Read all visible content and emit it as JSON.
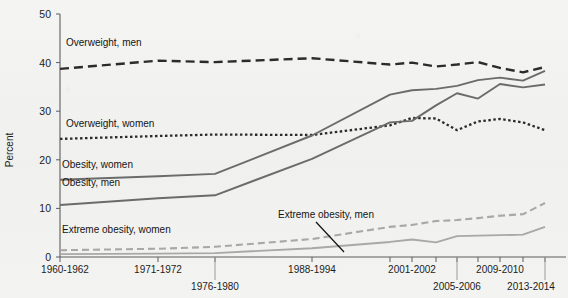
{
  "chart_data": {
    "type": "line",
    "title": "",
    "xlabel": "",
    "ylabel": "Percent",
    "ylim": [
      0,
      50
    ],
    "yticks": [
      0,
      10,
      20,
      30,
      40,
      50
    ],
    "grid": false,
    "legend": "inline-labels",
    "categories": [
      "1960-1962",
      "1971-1974",
      "1976-1980",
      "1988-1994",
      "1999-2000",
      "2001-2002",
      "2003-2004",
      "2005-2006",
      "2007-2008",
      "2009-2010",
      "2011-2012",
      "2013-2014"
    ],
    "x_tick_labels": [
      "1960-1962",
      "1971-1972",
      "1976-1980",
      "1988-1994",
      "2001-2002",
      "2005-2006",
      "2009-2010",
      "2013-2014"
    ],
    "series": [
      {
        "name": "Overweight, men",
        "style": "long-dash",
        "color": "#2b2b2b",
        "values": [
          38.7,
          40.4,
          40.1,
          40.9,
          39.6,
          40.0,
          39.2,
          39.6,
          40.1,
          38.9,
          38.0,
          39.1
        ]
      },
      {
        "name": "Overweight, women",
        "style": "dotted",
        "color": "#2b2b2b",
        "values": [
          24.3,
          24.9,
          25.2,
          25.1,
          27.1,
          28.6,
          28.5,
          26.1,
          27.9,
          28.4,
          27.7,
          26.1
        ]
      },
      {
        "name": "Obesity, women",
        "style": "solid",
        "color": "#6b6b6b",
        "values": [
          15.9,
          16.6,
          17.1,
          25.0,
          33.4,
          34.3,
          34.6,
          35.2,
          36.4,
          36.9,
          36.3,
          38.3
        ]
      },
      {
        "name": "Obesity, men",
        "style": "solid",
        "color": "#6b6b6b",
        "values": [
          10.7,
          12.1,
          12.7,
          20.2,
          27.7,
          28.0,
          31.2,
          33.7,
          32.6,
          35.6,
          34.9,
          35.5
        ]
      },
      {
        "name": "Extreme obesity, women",
        "style": "dashed",
        "color": "#a8a8a8",
        "values": [
          1.4,
          1.7,
          2.1,
          3.7,
          6.2,
          6.6,
          7.4,
          7.6,
          8.0,
          8.5,
          8.8,
          11.1
        ]
      },
      {
        "name": "Extreme obesity, men",
        "style": "solid",
        "color": "#a8a8a8",
        "values": [
          0.6,
          0.7,
          0.8,
          1.8,
          3.1,
          3.6,
          3.0,
          4.3,
          4.4,
          4.5,
          4.6,
          6.2
        ]
      }
    ],
    "annotations": [
      {
        "text": "Overweight, men",
        "x": 66,
        "y": 46
      },
      {
        "text": "Overweight, women",
        "x": 66,
        "y": 127
      },
      {
        "text": "Obesity, women",
        "x": 62,
        "y": 168
      },
      {
        "text": "Obesity, men",
        "x": 62,
        "y": 186
      },
      {
        "text": "Extreme obesity, women",
        "x": 62,
        "y": 233
      },
      {
        "text": "Extreme obesity, men",
        "x": 278,
        "y": 218
      }
    ]
  },
  "axis": {
    "y_title": "Percent"
  }
}
